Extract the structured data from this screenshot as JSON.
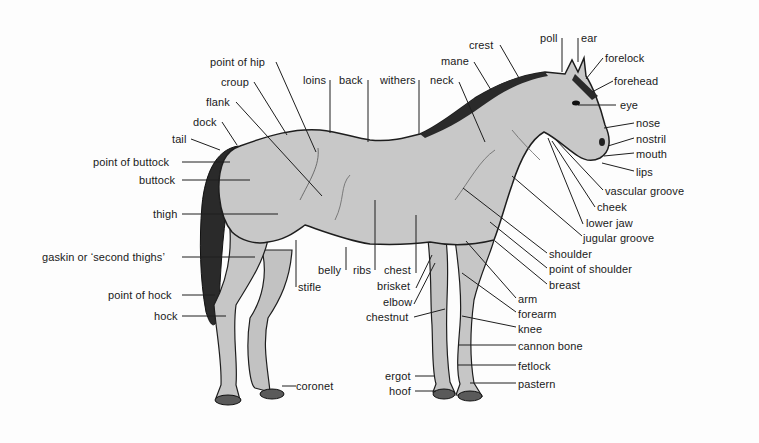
{
  "diagram": {
    "colors": {
      "body": "#c8c8c8",
      "outline": "#1e1e1e",
      "mane_tail": "#2a2a2a",
      "text": "#1a1a1a",
      "background": "#fdfdfd"
    },
    "labels": {
      "point_of_hip": "point of hip",
      "croup": "croup",
      "loins": "loins",
      "back": "back",
      "withers": "withers",
      "neck": "neck",
      "mane": "mane",
      "crest": "crest",
      "poll": "poll",
      "ear": "ear",
      "forelock": "forelock",
      "forehead": "forehead",
      "eye": "eye",
      "nose": "nose",
      "nostril": "nostril",
      "mouth": "mouth",
      "lips": "lips",
      "vascular_groove": "vascular groove",
      "cheek": "cheek",
      "lower_jaw": "lower jaw",
      "jugular_groove": "jugular groove",
      "shoulder": "shoulder",
      "point_of_shoulder": "point of shoulder",
      "breast": "breast",
      "arm": "arm",
      "forearm": "forearm",
      "knee": "knee",
      "cannon_bone": "cannon bone",
      "fetlock": "fetlock",
      "pastern": "pastern",
      "flank": "flank",
      "dock": "dock",
      "tail": "tail",
      "point_of_buttock": "point of buttock",
      "buttock": "buttock",
      "thigh": "thigh",
      "gaskin": "gaskin or ‘second thighs’",
      "point_of_hock": "point of hock",
      "hock": "hock",
      "coronet": "coronet",
      "stifle": "stifle",
      "belly": "belly",
      "ribs": "ribs",
      "chest": "chest",
      "brisket": "brisket",
      "elbow": "elbow",
      "chestnut": "chestnut",
      "ergot": "ergot",
      "hoof": "hoof"
    }
  }
}
